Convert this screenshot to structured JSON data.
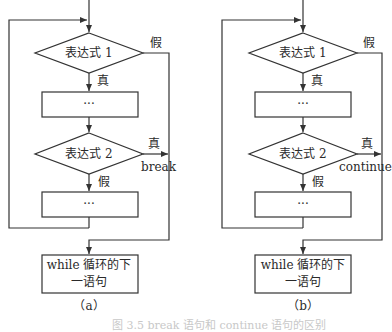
{
  "diagrams": [
    {
      "id": "a",
      "caption": "（a）",
      "cond1": "表达式 1",
      "cond1_true": "真",
      "cond1_false": "假",
      "body1": "···",
      "cond2": "表达式 2",
      "cond2_true": "真",
      "cond2_false": "假",
      "jump": "break",
      "body2": "···",
      "next_stmt_line1": "while 循环的下",
      "next_stmt_line2": "一语句"
    },
    {
      "id": "b",
      "caption": "（b）",
      "cond1": "表达式 1",
      "cond1_true": "真",
      "cond1_false": "假",
      "body1": "···",
      "cond2": "表达式 2",
      "cond2_true": "真",
      "cond2_false": "假",
      "jump": "continue",
      "body2": "···",
      "next_stmt_line1": "while 循环的下",
      "next_stmt_line2": "一语句"
    }
  ],
  "figure_caption": "图 3.5  break 语句和 continue 语句的区别",
  "colors": {
    "line": "#333333",
    "background": "#ffffff"
  }
}
